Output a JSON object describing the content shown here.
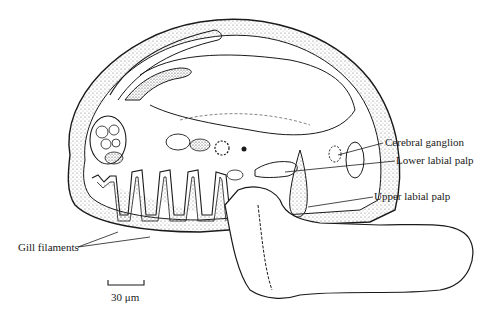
{
  "figure": {
    "type": "biological cross-section illustration",
    "labels": {
      "cerebral_ganglion": "Cerebral ganglion",
      "lower_labial_palp": "Lower labial palp",
      "upper_labial_palp": "Upper labial palp",
      "gill_filaments": "Gill filaments"
    },
    "scale_bar": {
      "label": "30 μm"
    },
    "colors": {
      "ink": "#1a1a1a",
      "background": "#ffffff",
      "stipple": "#555555"
    }
  }
}
